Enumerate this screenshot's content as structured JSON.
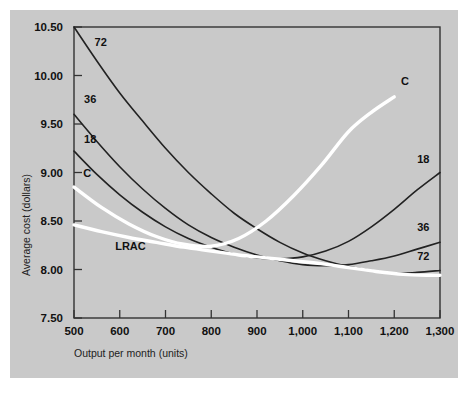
{
  "figure": {
    "background_color": "#ffffff",
    "panel_color": "#c9c9c9",
    "curve_color": "#222222",
    "highlight_color": "#ffffff"
  },
  "chart_data": {
    "type": "line",
    "title": "",
    "xlabel": "Output per month (units)",
    "ylabel": "Average cost (dollars)",
    "xlim": [
      500,
      1300
    ],
    "ylim": [
      7.5,
      10.5
    ],
    "xticks": [
      500,
      600,
      700,
      800,
      900,
      1000,
      1100,
      1200,
      1300
    ],
    "xtick_labels": [
      "500",
      "600",
      "700",
      "800",
      "900",
      "1,000",
      "1,100",
      "1,200",
      "1,300"
    ],
    "yticks": [
      7.5,
      8.0,
      8.5,
      9.0,
      9.5,
      10.0,
      10.5
    ],
    "ytick_labels": [
      "7.50",
      "8.00",
      "8.50",
      "9.00",
      "9.50",
      "10.00",
      "10.50"
    ],
    "grid": false,
    "legend": "inline-curve-labels",
    "series": [
      {
        "name": "18",
        "style": "black",
        "label_left": "18",
        "label_right": "18",
        "x": [
          500,
          550,
          600,
          650,
          700,
          750,
          800,
          850,
          900,
          950,
          1000,
          1050,
          1100,
          1150,
          1200,
          1250,
          1300
        ],
        "y": [
          9.22,
          8.98,
          8.77,
          8.59,
          8.44,
          8.32,
          8.23,
          8.16,
          8.12,
          8.11,
          8.13,
          8.19,
          8.29,
          8.44,
          8.62,
          8.82,
          9.0
        ]
      },
      {
        "name": "36",
        "style": "black",
        "label_left": "36",
        "label_right": "36",
        "x": [
          500,
          550,
          600,
          650,
          700,
          750,
          800,
          850,
          900,
          950,
          1000,
          1050,
          1100,
          1150,
          1200,
          1250,
          1300
        ],
        "y": [
          9.6,
          9.32,
          9.06,
          8.83,
          8.63,
          8.46,
          8.33,
          8.23,
          8.15,
          8.09,
          8.05,
          8.04,
          8.05,
          8.09,
          8.14,
          8.21,
          8.28
        ]
      },
      {
        "name": "72",
        "style": "black",
        "label_left": "72",
        "label_right": "72",
        "x": [
          500,
          550,
          600,
          650,
          700,
          750,
          800,
          850,
          900,
          950,
          1000,
          1050,
          1100,
          1150,
          1200,
          1250,
          1300
        ],
        "y": [
          10.5,
          10.15,
          9.82,
          9.53,
          9.25,
          9.0,
          8.78,
          8.58,
          8.42,
          8.28,
          8.17,
          8.09,
          8.03,
          7.99,
          7.96,
          7.97,
          7.99
        ]
      },
      {
        "name": "LRAC",
        "style": "white",
        "label_left": "LRAC",
        "label_right": "",
        "x": [
          500,
          560,
          620,
          680,
          740,
          800,
          860,
          920,
          980,
          1040,
          1100,
          1160,
          1220,
          1280,
          1300
        ],
        "y": [
          8.46,
          8.39,
          8.33,
          8.28,
          8.23,
          8.19,
          8.15,
          8.12,
          8.09,
          8.06,
          8.02,
          7.98,
          7.95,
          7.94,
          7.94
        ]
      },
      {
        "name": "C",
        "style": "white",
        "label_left": "C",
        "label_right": "C",
        "x": [
          500,
          560,
          620,
          680,
          740,
          800,
          860,
          920,
          980,
          1040,
          1100,
          1150,
          1200
        ],
        "y": [
          8.85,
          8.64,
          8.47,
          8.34,
          8.26,
          8.24,
          8.32,
          8.5,
          8.76,
          9.07,
          9.42,
          9.62,
          9.78
        ]
      }
    ],
    "annotations": [
      {
        "text": "72",
        "x": 545,
        "y": 10.3,
        "anchor": "start"
      },
      {
        "text": "36",
        "x": 522,
        "y": 9.72,
        "anchor": "start"
      },
      {
        "text": "18",
        "x": 522,
        "y": 9.3,
        "anchor": "start"
      },
      {
        "text": "C",
        "x": 520,
        "y": 8.95,
        "anchor": "start"
      },
      {
        "text": "LRAC",
        "x": 590,
        "y": 8.2,
        "anchor": "start"
      },
      {
        "text": "C",
        "x": 1215,
        "y": 9.9,
        "anchor": "start"
      },
      {
        "text": "18",
        "x": 1250,
        "y": 9.1,
        "anchor": "start"
      },
      {
        "text": "36",
        "x": 1250,
        "y": 8.4,
        "anchor": "start"
      },
      {
        "text": "72",
        "x": 1250,
        "y": 8.1,
        "anchor": "start"
      }
    ]
  }
}
